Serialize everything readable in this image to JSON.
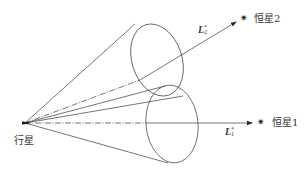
{
  "diagram": {
    "type": "geometric-optics-cones",
    "colors": {
      "stroke": "#3a3a3a",
      "background": "#ffffff",
      "text": "#333333"
    },
    "planet": {
      "label": "行星",
      "x": 25,
      "y": 123
    },
    "stars": [
      {
        "id": "star1",
        "label": "恒星1",
        "marker": "✷",
        "line_label": "L",
        "line_sup": "*",
        "line_sub": "1"
      },
      {
        "id": "star2",
        "label": "恒星2",
        "marker": "✷",
        "line_label": "L",
        "line_sup": "*",
        "line_sub": "2"
      }
    ],
    "cones": [
      {
        "id": "cone-upper",
        "axis_to": "star2"
      },
      {
        "id": "cone-lower",
        "axis_to": "star1"
      }
    ]
  }
}
